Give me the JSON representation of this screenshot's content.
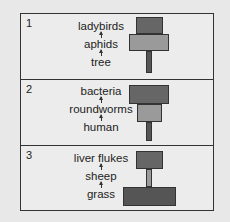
{
  "panels": [
    {
      "number": "1",
      "chain": [
        "ladybirds",
        "aphids",
        "tree"
      ],
      "pyramid": [
        {
          "level": "ladybirds",
          "color": "#666666"
        },
        {
          "level": "aphids",
          "color": "#9a9a9a"
        },
        {
          "level": "tree",
          "color": "#555555"
        }
      ]
    },
    {
      "number": "2",
      "chain": [
        "bacteria",
        "roundworms",
        "human"
      ],
      "pyramid": [
        {
          "level": "bacteria",
          "color": "#666666"
        },
        {
          "level": "roundworms",
          "color": "#9a9a9a"
        },
        {
          "level": "human",
          "color": "#555555"
        }
      ]
    },
    {
      "number": "3",
      "chain": [
        "liver flukes",
        "sheep",
        "grass"
      ],
      "pyramid": [
        {
          "level": "liver flukes",
          "color": "#666666"
        },
        {
          "level": "sheep",
          "color": "#9a9a9a"
        },
        {
          "level": "grass",
          "color": "#555555"
        }
      ]
    }
  ]
}
